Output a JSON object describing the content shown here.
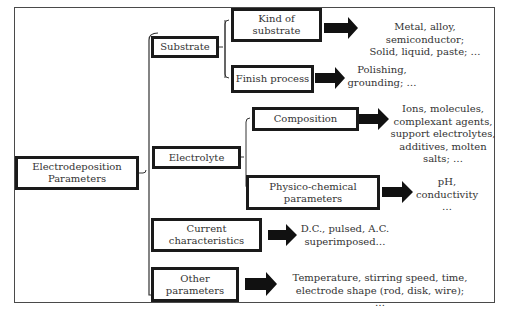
{
  "diagram": {
    "root": {
      "label": "Electrodeposition\nParameters"
    },
    "categories": [
      {
        "label": "Substrate",
        "children": [
          {
            "label": "Kind of\nsubstrate",
            "description": "Metal,  alloy,\nsemiconductor;\nSolid, liquid, paste; …"
          },
          {
            "label": "Finish process",
            "description": "Polishing,\ngrounding; …"
          }
        ]
      },
      {
        "label": "Electrolyte",
        "children": [
          {
            "label": "Composition",
            "description": "Ions, molecules,\ncomplexant agents,\nsupport  electrolytes,\nadditives, molten\nsalts; …"
          },
          {
            "label": "Physico-chemical\nparameters",
            "description": "pH,\nconductivity\n…"
          }
        ]
      },
      {
        "label": "Current\ncharacteristics",
        "description": "D.C.,  pulsed,  A.C.\nsuperimposed…"
      },
      {
        "label": "Other\nparameters",
        "description": "Temperature, stirring speed,  time,\nelectrode shape (rod,  disk, wire); …"
      }
    ],
    "colors": {
      "box_border": "#1a1a1a",
      "arrow": "#111111",
      "line": "#333333",
      "text": "#333333"
    }
  }
}
